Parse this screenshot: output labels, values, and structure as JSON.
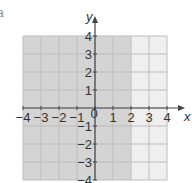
{
  "panel_label": "a",
  "chart_data": {
    "type": "region",
    "title": "",
    "xlabel": "x",
    "ylabel": "y",
    "xlim": [
      -4,
      4
    ],
    "ylim": [
      -4,
      4
    ],
    "grid": true,
    "x_ticks": [
      -4,
      -3,
      -2,
      -1,
      0,
      1,
      2,
      3,
      4
    ],
    "y_ticks": [
      -4,
      -3,
      -2,
      -1,
      1,
      2,
      3,
      4
    ],
    "x_tick_labels": [
      "−4",
      "−3",
      "−2",
      "−1",
      "0",
      "1",
      "2",
      "3",
      "4"
    ],
    "y_tick_labels": [
      "−4",
      "−3",
      "−2",
      "−1",
      "1",
      "2",
      "3",
      "4"
    ],
    "regions": [
      {
        "name": "shaded",
        "inequality": "x ≤ 2",
        "x_range": [
          -4,
          2
        ],
        "y_range": [
          -4,
          4
        ],
        "color": "#d4d4d4"
      },
      {
        "name": "unshaded",
        "inequality": "x > 2",
        "x_range": [
          2,
          4
        ],
        "y_range": [
          -4,
          4
        ],
        "color": "#efefef"
      }
    ],
    "boundary_line": "x = 2"
  },
  "colors": {
    "grid_line": "#bdbdbd",
    "axis": "#444444",
    "text": "#333333"
  }
}
